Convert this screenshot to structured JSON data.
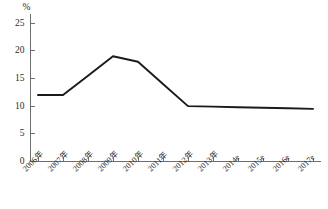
{
  "chart_data": {
    "type": "line",
    "title": "",
    "subtitle": "",
    "xlabel": "",
    "ylabel": "",
    "unit_label": "%",
    "categories": [
      "2006年",
      "2007年",
      "2008年",
      "2009年",
      "2010年",
      "2011年",
      "2012年",
      "2013年",
      "2014e",
      "2015e",
      "2016e",
      "2017e"
    ],
    "values": [
      12.0,
      12.0,
      15.5,
      19.0,
      18.0,
      14.0,
      10.0,
      9.9,
      9.8,
      9.7,
      9.6,
      9.5
    ],
    "series": [
      {
        "name": "",
        "values": [
          12.0,
          12.0,
          15.5,
          19.0,
          18.0,
          14.0,
          10.0,
          9.9,
          9.8,
          9.7,
          9.6,
          9.5
        ]
      }
    ],
    "ylim": [
      0,
      25
    ],
    "yticks": [
      0,
      5,
      10,
      15,
      20,
      25
    ],
    "ytick_labels": [
      "0",
      "5",
      "10",
      "15",
      "20",
      "25"
    ],
    "grid": false,
    "legend": "none",
    "line_color": "#1a1a1a",
    "axis_color": "#6e6e6e"
  }
}
